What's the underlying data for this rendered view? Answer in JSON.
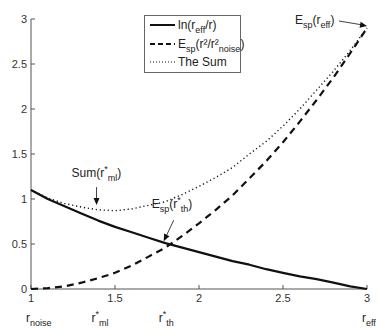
{
  "chart_data": {
    "type": "line",
    "title": "",
    "xlabel": "",
    "ylabel": "",
    "xlim": [
      1,
      3
    ],
    "ylim": [
      0,
      3
    ],
    "grid": false,
    "legend_position": "top-center (inside)",
    "x_ticks": [
      "1",
      "1.5",
      "2",
      "2.5",
      "3"
    ],
    "y_ticks": [
      "0",
      "0.5",
      "1",
      "1.5",
      "2",
      "2.5",
      "3"
    ],
    "x_special_labels": [
      {
        "x": 1.0,
        "main": "r",
        "sub": "noise",
        "sup": ""
      },
      {
        "x": 1.39,
        "main": "r",
        "sub": "ml",
        "sup": "*"
      },
      {
        "x": 1.79,
        "main": "r",
        "sub": "th",
        "sup": "*"
      },
      {
        "x": 3.0,
        "main": "r",
        "sub": "eff",
        "sup": ""
      }
    ],
    "x": [
      1.0,
      1.1,
      1.2,
      1.3,
      1.4,
      1.5,
      1.6,
      1.7,
      1.8,
      1.9,
      2.0,
      2.1,
      2.2,
      2.3,
      2.4,
      2.5,
      2.6,
      2.7,
      2.8,
      2.9,
      3.0
    ],
    "series": [
      {
        "name": "ln(r_eff/r)",
        "style": "solid",
        "values": [
          1.1,
          1.0,
          0.92,
          0.84,
          0.76,
          0.69,
          0.63,
          0.57,
          0.51,
          0.46,
          0.41,
          0.36,
          0.31,
          0.27,
          0.22,
          0.18,
          0.14,
          0.11,
          0.07,
          0.03,
          0.0
        ]
      },
      {
        "name": "E_sp(r^2/r_noise^2)",
        "style": "dashed",
        "values": [
          0.0,
          0.01,
          0.03,
          0.07,
          0.12,
          0.18,
          0.26,
          0.36,
          0.46,
          0.59,
          0.73,
          0.88,
          1.04,
          1.23,
          1.42,
          1.63,
          1.86,
          2.1,
          2.35,
          2.62,
          2.9
        ]
      },
      {
        "name": "The Sum",
        "style": "dotted",
        "values": [
          1.1,
          1.01,
          0.95,
          0.91,
          0.88,
          0.87,
          0.89,
          0.93,
          0.97,
          1.05,
          1.14,
          1.24,
          1.35,
          1.5,
          1.64,
          1.81,
          2.0,
          2.21,
          2.42,
          2.65,
          2.9
        ]
      }
    ],
    "annotations": [
      {
        "text": "Sum(r*_ml)",
        "point": [
          1.39,
          0.91
        ],
        "arrow": "down"
      },
      {
        "text": "E_sp(r*_th)",
        "point": [
          1.79,
          0.52
        ],
        "arrow": "down-left"
      },
      {
        "text": "E_sp(r_eff)",
        "point": [
          3.0,
          2.9
        ],
        "arrow": "right"
      }
    ]
  },
  "legend": {
    "items": [
      {
        "main": "ln(r",
        "sub": "eff",
        "tail": "/r)",
        "style": "solid"
      },
      {
        "main": "E",
        "sub": "sp",
        "tail": "(r²/r²",
        "sub2": "noise",
        "tail2": ")",
        "style": "dashed"
      },
      {
        "main": "The Sum",
        "style": "dotted"
      }
    ]
  },
  "colors": {
    "line": "#111111",
    "axis": "#555555",
    "text": "#333333",
    "background": "#ffffff"
  }
}
